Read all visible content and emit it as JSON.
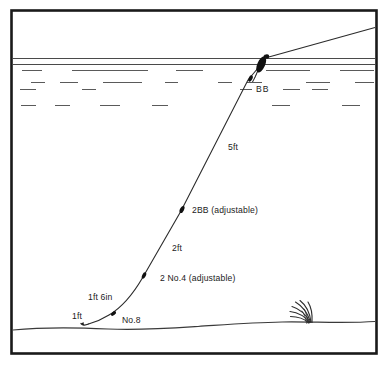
{
  "diagram": {
    "frame": {
      "border_color": "#1a1a1a",
      "background_color": "#ffffff"
    },
    "colors": {
      "line": "#2b2b2b",
      "water": "#4a4a4a",
      "shot": "#111111",
      "float": "#111111",
      "bed": "#3a3a3a",
      "weed": "#2e2e2e",
      "text": "#1b1b1b"
    },
    "labels": [
      {
        "id": "bb",
        "text": "BB",
        "x": 256,
        "y": 92,
        "anchor": "start"
      },
      {
        "id": "five-ft",
        "text": "5ft",
        "x": 228,
        "y": 150,
        "anchor": "start"
      },
      {
        "id": "two-bb",
        "text": "2BB (adjustable)",
        "x": 192,
        "y": 213,
        "anchor": "start"
      },
      {
        "id": "two-ft",
        "text": "2ft",
        "x": 172,
        "y": 251,
        "anchor": "start"
      },
      {
        "id": "two-no4",
        "text": "2 No.4 (adjustable)",
        "x": 160,
        "y": 281,
        "anchor": "start"
      },
      {
        "id": "one-ft-six",
        "text": "1ft 6in",
        "x": 88,
        "y": 300,
        "anchor": "start"
      },
      {
        "id": "one-ft",
        "text": "1ft",
        "x": 72,
        "y": 319,
        "anchor": "start"
      },
      {
        "id": "no8",
        "text": "No.8",
        "x": 122,
        "y": 323,
        "anchor": "start"
      }
    ],
    "components": {
      "float_name": "stick-float",
      "shots": [
        {
          "id": "bb-shot",
          "size": "BB",
          "x": 250,
          "y": 80
        },
        {
          "id": "2bb-shot",
          "size": "2BB",
          "x": 182,
          "y": 210
        },
        {
          "id": "no4-shot",
          "size": "2 No.4",
          "x": 144,
          "y": 276
        },
        {
          "id": "no8-shot",
          "size": "No.8",
          "x": 113,
          "y": 314
        }
      ],
      "hook_name": "hook-end",
      "weed_name": "weed-tuft",
      "bed_name": "lake-bed",
      "surface_name": "water-surface"
    }
  }
}
